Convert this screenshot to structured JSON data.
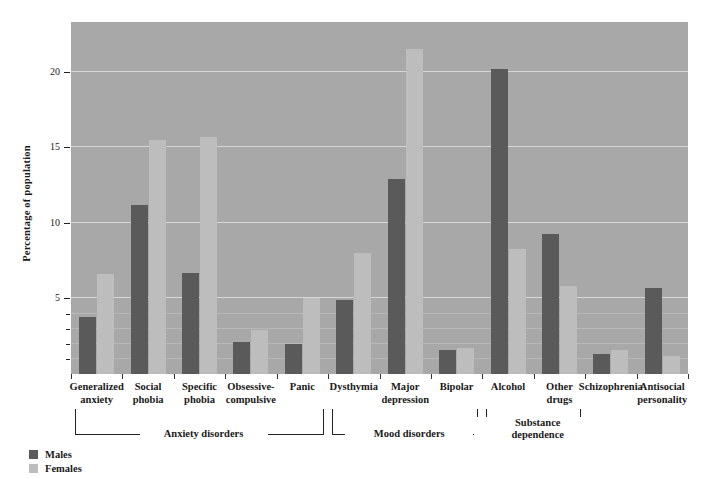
{
  "chart_data": {
    "type": "bar",
    "title": "",
    "xlabel": "",
    "ylabel": "Percentage of population",
    "ylim": [
      0,
      23.3
    ],
    "yticks": [
      5,
      10,
      15,
      20
    ],
    "ytick_labels": [
      "5",
      "10",
      "15",
      "20"
    ],
    "minor_yticks": [
      1,
      2,
      3,
      4
    ],
    "grid": true,
    "legend_position": "bottom-left",
    "categories": [
      "Generalized anxiety",
      "Social phobia",
      "Specific phobia",
      "Obsessive-compulsive",
      "Panic",
      "Dysthymia",
      "Major depression",
      "Bipolar",
      "Alcohol",
      "Other drugs",
      "Schizophrenia",
      "Antisocial personality"
    ],
    "category_lines": [
      [
        "Generalized",
        "anxiety"
      ],
      [
        "Social",
        "phobia"
      ],
      [
        "Specific",
        "phobia"
      ],
      [
        "Obsessive-",
        "compulsive"
      ],
      [
        "Panic"
      ],
      [
        "Dysthymia"
      ],
      [
        "Major",
        "depression"
      ],
      [
        "Bipolar"
      ],
      [
        "Alcohol"
      ],
      [
        "Other",
        "drugs"
      ],
      [
        "Schizophrenia"
      ],
      [
        "Antisocial",
        "personality"
      ]
    ],
    "series": [
      {
        "name": "Males",
        "color": "#5a5a5a",
        "values": [
          3.8,
          11.2,
          6.7,
          2.1,
          2.0,
          4.9,
          12.9,
          1.6,
          20.2,
          9.3,
          1.3,
          5.7
        ]
      },
      {
        "name": "Females",
        "color": "#bdbdbd",
        "values": [
          6.6,
          15.5,
          15.7,
          2.9,
          5.0,
          8.0,
          21.5,
          1.7,
          8.3,
          5.8,
          1.6,
          1.2
        ]
      }
    ],
    "groups": [
      {
        "label": "Anxiety disorders",
        "label_lines": [
          "Anxiety disorders"
        ],
        "start": 0,
        "end": 4
      },
      {
        "label": "Mood disorders",
        "label_lines": [
          "Mood disorders"
        ],
        "start": 5,
        "end": 7
      },
      {
        "label": "Substance dependence",
        "label_lines": [
          "Substance",
          "dependence"
        ],
        "start": 8,
        "end": 9
      }
    ]
  },
  "legend": {
    "items": [
      {
        "label": "Males",
        "color": "#5a5a5a"
      },
      {
        "label": "Females",
        "color": "#bdbdbd"
      }
    ]
  }
}
